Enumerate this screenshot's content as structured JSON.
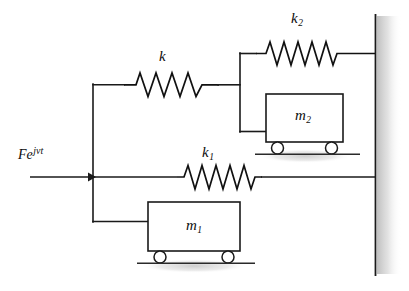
{
  "figure": {
    "kind": "mechanical-schematic",
    "background_color": "#ffffff",
    "line_color": "#1a1a1a",
    "shadow_color": "#c9c9c9",
    "width": 409,
    "height": 291
  },
  "labels": {
    "force": {
      "base": "Fe",
      "exponent": "jνt",
      "full": "Fe^{jνt}",
      "x": 18,
      "y": 152
    },
    "spring_k": {
      "symbol": "k",
      "subscript": "",
      "x": 160,
      "y": 50
    },
    "spring_k1": {
      "symbol": "k",
      "subscript": "1",
      "x": 203,
      "y": 146
    },
    "spring_k2": {
      "symbol": "k",
      "subscript": "2",
      "x": 292,
      "y": 12
    },
    "mass_m1": {
      "symbol": "m",
      "subscript": "1",
      "x": 192,
      "y": 222
    },
    "mass_m2": {
      "symbol": "m",
      "subscript": "2",
      "x": 293,
      "y": 110
    }
  },
  "components": {
    "wall": {
      "name": "fixed-wall",
      "x": 375,
      "top": 14,
      "bottom": 276,
      "hatch_style": "gray-gradient-shadow"
    },
    "mass_m1_body": {
      "name": "m1",
      "x": 148,
      "y": 202,
      "width": 92,
      "height": 49,
      "wheels": 2
    },
    "mass_m2_body": {
      "name": "m2",
      "x": 266,
      "y": 94,
      "width": 77,
      "height": 48,
      "wheels": 2
    },
    "spring_k_geom": {
      "name": "k",
      "x1": 123,
      "x2": 218,
      "y": 84,
      "coils": 7
    },
    "spring_k1_geom": {
      "name": "k1",
      "x1": 176,
      "x2": 262,
      "y": 177,
      "coils": 9
    },
    "spring_k2_geom": {
      "name": "k2",
      "x1": 255,
      "x2": 345,
      "y": 53,
      "coils": 9
    },
    "force_arrow": {
      "name": "force-input-arrow",
      "x1": 30,
      "x2": 93,
      "y": 177
    },
    "left_bus": {
      "name": "left-vertical-bus",
      "x": 93,
      "top": 84,
      "bottom": 222
    },
    "junction_bus": {
      "name": "k-to-k2-m2-junction",
      "x": 240,
      "top": 53,
      "bottom": 132
    }
  }
}
